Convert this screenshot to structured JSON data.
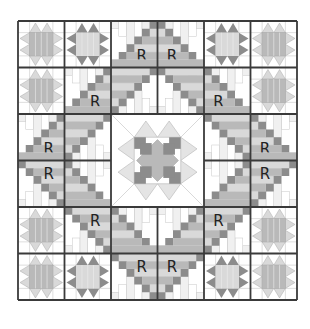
{
  "diagram": {
    "grid": {
      "rows": 6,
      "cols": 6,
      "left": 18,
      "top": 21,
      "cell": 46.5
    },
    "colors": {
      "outline": "#3a3a3a",
      "dark": "#8c8c8c",
      "medium": "#b9b9b9",
      "light": "#d9d9d9",
      "paper": "#ffffff",
      "pale_line": "#c8c8c8"
    },
    "center_block": {
      "row": 2,
      "col": 2,
      "span": 2,
      "type": "ohio-star-sawtooth"
    },
    "star_blocks": [
      {
        "row": 0,
        "col": 0,
        "style": "light"
      },
      {
        "row": 0,
        "col": 1,
        "style": "dark"
      },
      {
        "row": 0,
        "col": 4,
        "style": "dark"
      },
      {
        "row": 0,
        "col": 5,
        "style": "light"
      },
      {
        "row": 1,
        "col": 0,
        "style": "light"
      },
      {
        "row": 1,
        "col": 5,
        "style": "light"
      },
      {
        "row": 4,
        "col": 0,
        "style": "light"
      },
      {
        "row": 4,
        "col": 5,
        "style": "light"
      },
      {
        "row": 5,
        "col": 0,
        "style": "light"
      },
      {
        "row": 5,
        "col": 1,
        "style": "dark"
      },
      {
        "row": 5,
        "col": 4,
        "style": "dark"
      },
      {
        "row": 5,
        "col": 5,
        "style": "light"
      }
    ],
    "r_blocks": [
      {
        "row": 0,
        "col": 2,
        "corner": "br",
        "label": "R"
      },
      {
        "row": 0,
        "col": 3,
        "corner": "bl",
        "label": "R"
      },
      {
        "row": 1,
        "col": 1,
        "corner": "br",
        "label": "R"
      },
      {
        "row": 1,
        "col": 2,
        "corner": "tl",
        "label": ""
      },
      {
        "row": 1,
        "col": 3,
        "corner": "tr",
        "label": ""
      },
      {
        "row": 1,
        "col": 4,
        "corner": "bl",
        "label": "R"
      },
      {
        "row": 2,
        "col": 0,
        "corner": "br",
        "label": "R"
      },
      {
        "row": 2,
        "col": 1,
        "corner": "tl",
        "label": ""
      },
      {
        "row": 2,
        "col": 4,
        "corner": "tr",
        "label": ""
      },
      {
        "row": 2,
        "col": 5,
        "corner": "bl",
        "label": "R"
      },
      {
        "row": 3,
        "col": 0,
        "corner": "tr",
        "label": "R"
      },
      {
        "row": 3,
        "col": 1,
        "corner": "bl",
        "label": ""
      },
      {
        "row": 3,
        "col": 4,
        "corner": "br",
        "label": ""
      },
      {
        "row": 3,
        "col": 5,
        "corner": "tl",
        "label": "R"
      },
      {
        "row": 4,
        "col": 1,
        "corner": "tr",
        "label": "R"
      },
      {
        "row": 4,
        "col": 2,
        "corner": "bl",
        "label": ""
      },
      {
        "row": 4,
        "col": 3,
        "corner": "br",
        "label": ""
      },
      {
        "row": 4,
        "col": 4,
        "corner": "tl",
        "label": "R"
      },
      {
        "row": 5,
        "col": 2,
        "corner": "tr",
        "label": "R"
      },
      {
        "row": 5,
        "col": 3,
        "corner": "tl",
        "label": "R"
      }
    ]
  }
}
